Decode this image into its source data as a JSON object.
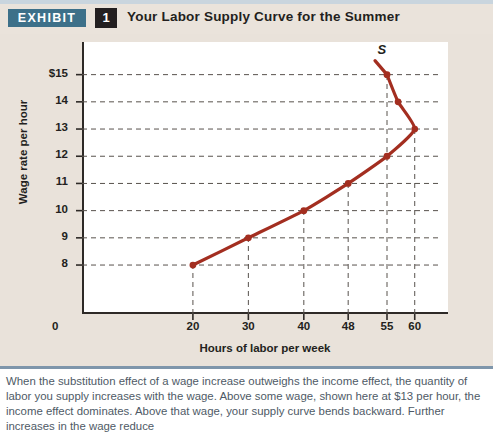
{
  "header": {
    "exhibit_tag": "EXHIBIT",
    "exhibit_number": "1",
    "title": "Your Labor Supply Curve for the Summer",
    "tag_color": "#3d7089",
    "number_color": "#231f20",
    "topline_color": "#c9d5de"
  },
  "caption": {
    "text": "When the substitution effect of a wage increase outweighs the income effect, the quantity of labor you supply increases with the wage. Above some wage, shown here at $13 per hour, the income effect dominates. Above that wage, your supply curve bends backward. Further increases in the wage reduce",
    "rule_color": "#7f96ab"
  },
  "chart_data": {
    "type": "line",
    "title": "Your Labor Supply Curve for the Summer",
    "xlabel": "Hours of labor per week",
    "ylabel": "Wage rate per hour",
    "x_ticks": [
      0,
      20,
      30,
      40,
      48,
      55,
      60
    ],
    "x_tick_labels": [
      "0",
      "20",
      "30",
      "40",
      "48",
      "55",
      "60"
    ],
    "y_ticks": [
      8,
      9,
      10,
      11,
      12,
      13,
      14,
      15
    ],
    "y_tick_labels": [
      "8",
      "9",
      "10",
      "11",
      "12",
      "13",
      "14",
      "15"
    ],
    "y_top_label": "$15",
    "xlim": [
      0,
      66
    ],
    "ylim": [
      6.2,
      16.2
    ],
    "grid": "dashed-horizontal-and-vertical-to-points",
    "legend": "none",
    "series": [
      {
        "name": "S",
        "label": "S",
        "color": "#a32e20",
        "points": [
          {
            "x": 20,
            "y": 8
          },
          {
            "x": 30,
            "y": 9
          },
          {
            "x": 40,
            "y": 10
          },
          {
            "x": 48,
            "y": 11
          },
          {
            "x": 55,
            "y": 12
          },
          {
            "x": 60,
            "y": 13
          },
          {
            "x": 57,
            "y": 14
          },
          {
            "x": 55,
            "y": 15
          }
        ]
      }
    ],
    "annotations": [
      {
        "text": "S",
        "x": 54,
        "y": 15.9,
        "style": "italic"
      }
    ]
  }
}
